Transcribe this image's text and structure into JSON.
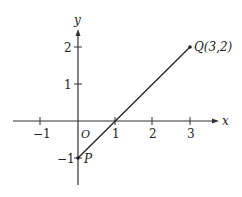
{
  "diagram": {
    "type": "coordinate-plane-line-segment",
    "axes": {
      "x_label": "x",
      "y_label": "y",
      "origin_label": "O",
      "x_ticks": [
        {
          "value": -1,
          "label": "−1"
        },
        {
          "value": 1,
          "label": "1"
        },
        {
          "value": 2,
          "label": "2"
        },
        {
          "value": 3,
          "label": "3"
        }
      ],
      "y_ticks": [
        {
          "value": 2,
          "label": "2"
        },
        {
          "value": 1,
          "label": "1"
        },
        {
          "value": -1,
          "label": "−1"
        }
      ]
    },
    "points": {
      "P": {
        "label": "P",
        "x": 0,
        "y": -1
      },
      "Q": {
        "label": "Q(3,2)",
        "x": 3,
        "y": 2
      }
    },
    "segment": {
      "from": "P",
      "to": "Q"
    },
    "colors": {
      "line": "#222222",
      "background": "#ffffff"
    }
  }
}
